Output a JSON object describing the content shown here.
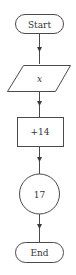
{
  "diagram": {
    "type": "flowchart",
    "direction": "top-to-bottom",
    "nodes": [
      {
        "id": "start",
        "shape": "terminal",
        "label": "Start"
      },
      {
        "id": "input",
        "shape": "parallelogram",
        "label": "x"
      },
      {
        "id": "process",
        "shape": "rectangle",
        "label": "+14"
      },
      {
        "id": "output",
        "shape": "circle",
        "label": "17"
      },
      {
        "id": "end",
        "shape": "terminal",
        "label": "End"
      }
    ],
    "edges": [
      {
        "from": "start",
        "to": "input"
      },
      {
        "from": "input",
        "to": "process"
      },
      {
        "from": "process",
        "to": "output"
      },
      {
        "from": "output",
        "to": "end"
      }
    ],
    "colors": {
      "stroke": "#4a4a4a",
      "text": "#333333",
      "background": "#ffffff"
    }
  }
}
